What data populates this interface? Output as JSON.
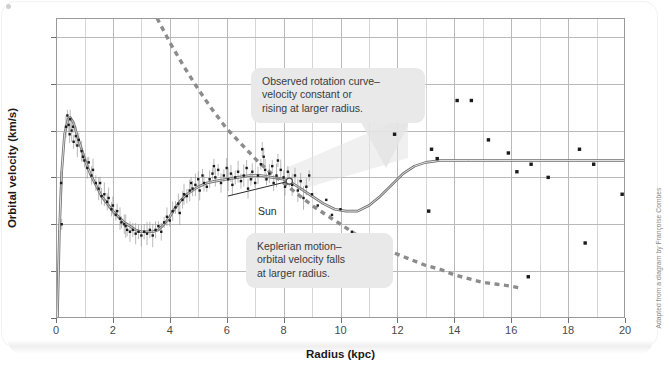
{
  "figure": {
    "attribution": "Adapted from a diagram by Françoise Combes",
    "sun_label": "Sun"
  },
  "callouts": {
    "observed": "Observed rotation curve–\nvelocity constant or\nrising at larger radius.",
    "keplerian": "Keplerian motion–\norbital velocity falls\nat larger radius."
  },
  "chart_data": {
    "type": "line",
    "title": "",
    "xlabel": "Radius (kpc)",
    "ylabel": "Orbital velocity (km/s)",
    "xlim": [
      0,
      20
    ],
    "ylim": [
      150,
      310
    ],
    "xticks": [
      0,
      2,
      4,
      6,
      8,
      10,
      12,
      14,
      16,
      18,
      20
    ],
    "yticks": [
      150,
      175,
      200,
      225,
      250,
      275,
      300
    ],
    "xtick_labels": [
      "0",
      "2",
      "4",
      "6",
      "8",
      "10",
      "12",
      "14",
      "16",
      "18",
      "20"
    ],
    "ytick_labels": [
      "150",
      "175",
      "200",
      "225",
      "250",
      "275",
      "300"
    ],
    "x_minor_step": 1,
    "grid": true,
    "legend": "none",
    "accent_colors": {
      "curve": "#6e6e6e",
      "dashed": "#8c8c8c",
      "points": "#1a1a1a",
      "grid": "#d6d6d6",
      "axis": "#9a9a9a",
      "callout_bg": "#e9e9e9",
      "text": "#3a3a3a"
    },
    "series": [
      {
        "name": "Observed rotation curve (model)",
        "style": "solid",
        "points": [
          [
            0.05,
            150
          ],
          [
            0.12,
            196
          ],
          [
            0.2,
            228
          ],
          [
            0.3,
            248
          ],
          [
            0.42,
            256
          ],
          [
            0.5,
            257
          ],
          [
            0.62,
            254
          ],
          [
            0.75,
            247
          ],
          [
            0.9,
            240
          ],
          [
            1.05,
            233
          ],
          [
            1.2,
            227
          ],
          [
            1.4,
            221
          ],
          [
            1.6,
            215
          ],
          [
            1.8,
            211
          ],
          [
            2.0,
            207
          ],
          [
            2.2,
            204
          ],
          [
            2.4,
            201
          ],
          [
            2.6,
            199
          ],
          [
            2.8,
            197
          ],
          [
            3.0,
            196
          ],
          [
            3.2,
            196
          ],
          [
            3.4,
            196
          ],
          [
            3.6,
            197
          ],
          [
            3.8,
            200
          ],
          [
            4.0,
            204
          ],
          [
            4.2,
            209
          ],
          [
            4.4,
            213
          ],
          [
            4.6,
            216
          ],
          [
            4.8,
            218
          ],
          [
            5.0,
            220
          ],
          [
            5.3,
            222
          ],
          [
            5.6,
            223
          ],
          [
            6.0,
            224
          ],
          [
            6.4,
            225
          ],
          [
            6.8,
            226
          ],
          [
            7.2,
            226
          ],
          [
            7.6,
            225
          ],
          [
            8.0,
            224
          ],
          [
            8.3,
            222
          ],
          [
            8.6,
            219
          ],
          [
            9.0,
            215
          ],
          [
            9.4,
            211
          ],
          [
            9.8,
            208
          ],
          [
            10.2,
            207
          ],
          [
            10.6,
            207
          ],
          [
            11.0,
            210
          ],
          [
            11.4,
            215
          ],
          [
            11.8,
            221
          ],
          [
            12.2,
            227
          ],
          [
            12.6,
            231
          ],
          [
            13.0,
            233
          ],
          [
            13.5,
            234
          ],
          [
            14.5,
            234
          ],
          [
            16.0,
            234
          ],
          [
            18.0,
            234
          ],
          [
            20.0,
            234
          ]
        ]
      },
      {
        "name": "Keplerian motion",
        "style": "dashed",
        "points": [
          [
            3.55,
            310
          ],
          [
            4.0,
            297
          ],
          [
            4.5,
            284
          ],
          [
            5.0,
            272
          ],
          [
            5.5,
            261
          ],
          [
            6.0,
            251
          ],
          [
            6.5,
            243
          ],
          [
            7.0,
            235
          ],
          [
            7.5,
            228
          ],
          [
            8.0,
            222
          ],
          [
            8.5,
            216
          ],
          [
            9.0,
            210
          ],
          [
            9.5,
            205
          ],
          [
            10.0,
            200
          ],
          [
            10.5,
            195
          ],
          [
            11.0,
            191
          ],
          [
            11.5,
            187
          ],
          [
            12.0,
            184
          ],
          [
            12.5,
            181
          ],
          [
            13.0,
            178
          ],
          [
            13.5,
            176
          ],
          [
            14.0,
            173
          ],
          [
            14.5,
            171
          ],
          [
            15.0,
            169
          ],
          [
            15.5,
            168
          ],
          [
            16.0,
            167
          ],
          [
            16.3,
            166
          ]
        ]
      }
    ],
    "scatter": {
      "name": "Measured orbital velocities",
      "marker": "square",
      "points": [
        [
          0.18,
          222
        ],
        [
          0.2,
          200
        ],
        [
          0.35,
          252
        ],
        [
          0.4,
          258
        ],
        [
          0.45,
          253
        ],
        [
          0.48,
          248
        ],
        [
          0.5,
          256
        ],
        [
          0.55,
          250
        ],
        [
          0.6,
          252
        ],
        [
          0.62,
          244
        ],
        [
          0.7,
          247
        ],
        [
          0.75,
          242
        ],
        [
          0.8,
          245
        ],
        [
          0.9,
          239
        ],
        [
          0.95,
          236
        ],
        [
          1.0,
          234
        ],
        [
          1.1,
          230
        ],
        [
          1.15,
          233
        ],
        [
          1.25,
          226
        ],
        [
          1.3,
          229
        ],
        [
          1.4,
          222
        ],
        [
          1.5,
          219
        ],
        [
          1.55,
          222
        ],
        [
          1.6,
          215
        ],
        [
          1.7,
          216
        ],
        [
          1.8,
          212
        ],
        [
          1.85,
          214
        ],
        [
          1.95,
          208
        ],
        [
          2.0,
          210
        ],
        [
          2.1,
          205
        ],
        [
          2.15,
          207
        ],
        [
          2.25,
          203
        ],
        [
          2.3,
          201
        ],
        [
          2.4,
          200
        ],
        [
          2.45,
          199
        ],
        [
          2.5,
          197
        ],
        [
          2.6,
          196
        ],
        [
          2.7,
          197
        ],
        [
          2.8,
          195
        ],
        [
          2.9,
          196
        ],
        [
          3.0,
          194
        ],
        [
          3.1,
          196
        ],
        [
          3.2,
          195
        ],
        [
          3.3,
          197
        ],
        [
          3.4,
          194
        ],
        [
          3.5,
          197
        ],
        [
          3.6,
          199
        ],
        [
          3.7,
          196
        ],
        [
          3.8,
          201
        ],
        [
          3.9,
          204
        ],
        [
          4.0,
          202
        ],
        [
          4.1,
          207
        ],
        [
          4.2,
          209
        ],
        [
          4.3,
          211
        ],
        [
          4.35,
          206
        ],
        [
          4.45,
          213
        ],
        [
          4.5,
          216
        ],
        [
          4.6,
          215
        ],
        [
          4.7,
          218
        ],
        [
          4.75,
          222
        ],
        [
          4.8,
          219
        ],
        [
          4.9,
          221
        ],
        [
          5.0,
          224
        ],
        [
          5.05,
          218
        ],
        [
          5.15,
          226
        ],
        [
          5.2,
          222
        ],
        [
          5.3,
          220
        ],
        [
          5.4,
          224
        ],
        [
          5.5,
          227
        ],
        [
          5.55,
          231
        ],
        [
          5.6,
          225
        ],
        [
          5.7,
          229
        ],
        [
          5.8,
          222
        ],
        [
          5.9,
          226
        ],
        [
          6.0,
          230
        ],
        [
          6.05,
          224
        ],
        [
          6.15,
          227
        ],
        [
          6.2,
          221
        ],
        [
          6.3,
          225
        ],
        [
          6.4,
          228
        ],
        [
          6.5,
          223
        ],
        [
          6.6,
          226
        ],
        [
          6.7,
          230
        ],
        [
          6.75,
          219
        ],
        [
          6.85,
          224
        ],
        [
          6.9,
          228
        ],
        [
          7.0,
          222
        ],
        [
          7.1,
          226
        ],
        [
          7.2,
          232
        ],
        [
          7.25,
          240
        ],
        [
          7.3,
          236
        ],
        [
          7.35,
          229
        ],
        [
          7.4,
          224
        ],
        [
          7.5,
          227
        ],
        [
          7.6,
          231
        ],
        [
          7.65,
          222
        ],
        [
          7.75,
          226
        ],
        [
          7.8,
          234
        ],
        [
          7.9,
          229
        ],
        [
          8.0,
          225
        ],
        [
          8.05,
          220
        ],
        [
          8.15,
          228
        ],
        [
          8.2,
          224
        ],
        [
          8.3,
          221
        ],
        [
          8.4,
          226
        ],
        [
          8.5,
          218
        ],
        [
          8.6,
          223
        ],
        [
          8.7,
          214
        ],
        [
          8.8,
          220
        ],
        [
          8.9,
          226
        ],
        [
          9.0,
          216
        ],
        [
          9.2,
          210
        ],
        [
          9.5,
          213
        ],
        [
          9.7,
          205
        ],
        [
          10.0,
          208
        ],
        [
          10.4,
          196
        ],
        [
          11.9,
          248
        ],
        [
          12.5,
          257
        ],
        [
          13.2,
          240
        ],
        [
          13.4,
          235
        ],
        [
          14.1,
          266
        ],
        [
          14.6,
          266
        ],
        [
          15.2,
          245
        ],
        [
          15.9,
          238
        ],
        [
          16.2,
          228
        ],
        [
          16.7,
          232
        ],
        [
          17.3,
          225
        ],
        [
          18.4,
          240
        ],
        [
          18.6,
          190
        ],
        [
          18.9,
          232
        ],
        [
          19.9,
          216
        ],
        [
          16.6,
          172
        ],
        [
          13.1,
          207
        ]
      ]
    },
    "markers": [
      {
        "name": "sun",
        "x": 8.2,
        "y": 223,
        "style": "open-circle"
      }
    ]
  }
}
